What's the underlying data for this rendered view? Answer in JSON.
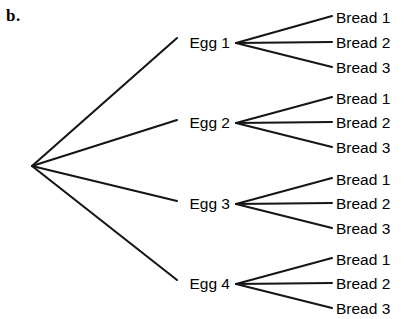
{
  "panel": {
    "label": "b."
  },
  "diagram": {
    "type": "tree",
    "root": {
      "label": "",
      "x": 32,
      "y": 166
    },
    "level1": [
      {
        "label": "Egg 1",
        "x": 232,
        "y": 43
      },
      {
        "label": "Egg 2",
        "x": 232,
        "y": 123
      },
      {
        "label": "Egg 3",
        "x": 232,
        "y": 204
      },
      {
        "label": "Egg 4",
        "x": 232,
        "y": 284
      }
    ],
    "level2_labels": [
      "Bread 1",
      "Bread 2",
      "Bread 3"
    ],
    "level2": [
      [
        {
          "label": "Bread 1",
          "x": 336,
          "y": 18
        },
        {
          "label": "Bread 2",
          "x": 336,
          "y": 43
        },
        {
          "label": "Bread 3",
          "x": 336,
          "y": 68
        }
      ],
      [
        {
          "label": "Bread 1",
          "x": 336,
          "y": 99
        },
        {
          "label": "Bread 2",
          "x": 336,
          "y": 123
        },
        {
          "label": "Bread 3",
          "x": 336,
          "y": 148
        }
      ],
      [
        {
          "label": "Bread 1",
          "x": 336,
          "y": 180
        },
        {
          "label": "Bread 2",
          "x": 336,
          "y": 204
        },
        {
          "label": "Bread 3",
          "x": 336,
          "y": 229
        }
      ],
      [
        {
          "label": "Bread 1",
          "x": 336,
          "y": 260
        },
        {
          "label": "Bread 2",
          "x": 336,
          "y": 284
        },
        {
          "label": "Bread 3",
          "x": 336,
          "y": 309
        }
      ]
    ],
    "counts": {
      "branches_level1": 4,
      "branches_per_node_level2": 3,
      "total_outcomes": 12
    },
    "style": {
      "line_color": "#151515",
      "text_color": "#000000",
      "background": "#ffffff",
      "line_width": 2.1
    }
  }
}
